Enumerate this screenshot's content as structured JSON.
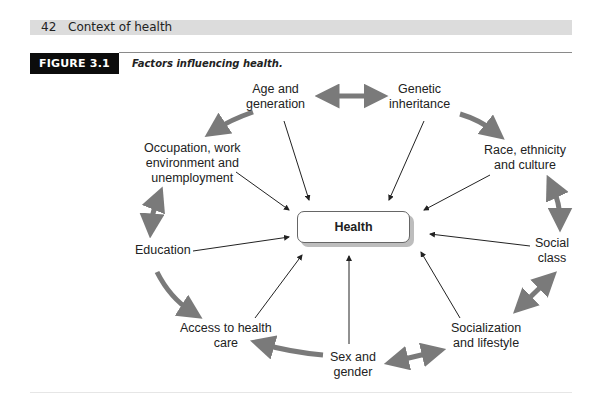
{
  "running_head": {
    "page_number": "42",
    "section_title": "Context of health"
  },
  "figure": {
    "label": "FIGURE 3.1",
    "caption": "Factors influencing health."
  },
  "diagram": {
    "center": {
      "label": "Health"
    },
    "factors": [
      {
        "id": "age",
        "lines": [
          "Age and",
          "generation"
        ]
      },
      {
        "id": "genetic",
        "lines": [
          "Genetic",
          "inheritance"
        ]
      },
      {
        "id": "race",
        "lines": [
          "Race, ethnicity",
          "and culture"
        ]
      },
      {
        "id": "social-class",
        "lines": [
          "Social",
          "class"
        ]
      },
      {
        "id": "socialization",
        "lines": [
          "Socialization",
          "and lifestyle"
        ]
      },
      {
        "id": "sex",
        "lines": [
          "Sex and",
          "gender"
        ]
      },
      {
        "id": "access",
        "lines": [
          "Access to health",
          "care"
        ]
      },
      {
        "id": "education",
        "lines": [
          "Education"
        ]
      },
      {
        "id": "occupation",
        "lines": [
          "Occupation, work",
          "environment and",
          "unemployment"
        ]
      }
    ],
    "colors": {
      "ring_arrow": "#7a7a7a",
      "thin_arrow": "#222222",
      "box_border": "#666666",
      "box_shadow": "#bdbdbd",
      "header_bar": "#dcdcdc",
      "label_bg": "#0c0c0c"
    }
  }
}
